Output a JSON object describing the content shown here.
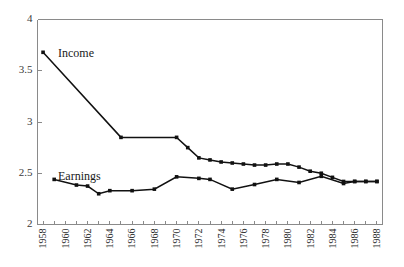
{
  "chart_data": {
    "type": "line",
    "title": "",
    "subtitle": "",
    "xlabel": "",
    "ylabel": "",
    "xlim": [
      1957.5,
      1988.5
    ],
    "ylim": [
      2,
      4
    ],
    "yticks": [
      2,
      2.5,
      3,
      3.5,
      4
    ],
    "ytick_labels": [
      "2",
      "2.5",
      "3",
      "3.5",
      "4"
    ],
    "xticks": [
      1958,
      1959,
      1960,
      1961,
      1962,
      1963,
      1964,
      1965,
      1966,
      1967,
      1968,
      1969,
      1970,
      1971,
      1972,
      1973,
      1974,
      1975,
      1976,
      1977,
      1978,
      1979,
      1980,
      1981,
      1982,
      1983,
      1984,
      1985,
      1986,
      1987,
      1988
    ],
    "xtick_labels": [
      "1958",
      "",
      "1960",
      "",
      "1962",
      "",
      "1964",
      "",
      "1966",
      "",
      "1968",
      "",
      "1970",
      "",
      "1972",
      "",
      "1974",
      "",
      "1976",
      "",
      "1978",
      "",
      "1980",
      "",
      "1982",
      "",
      "1984",
      "",
      "1986",
      "",
      "1988"
    ],
    "grid": false,
    "legend_position": "inline-annotation",
    "marker": "square",
    "series": [
      {
        "name": "Income",
        "annotation_label": "Income",
        "color": "#111111",
        "x": [
          1958,
          1965,
          1970,
          1971,
          1972,
          1973,
          1974,
          1975,
          1976,
          1977,
          1978,
          1979,
          1980,
          1981,
          1982,
          1983,
          1984,
          1985,
          1986,
          1987,
          1988
        ],
        "values": [
          3.68,
          2.85,
          2.85,
          2.75,
          2.65,
          2.63,
          2.61,
          2.6,
          2.59,
          2.58,
          2.58,
          2.59,
          2.59,
          2.56,
          2.52,
          2.5,
          2.46,
          2.42,
          2.42,
          2.42,
          2.42
        ]
      },
      {
        "name": "Earnings",
        "annotation_label": "Earnings",
        "color": "#111111",
        "x": [
          1959,
          1961,
          1962,
          1963,
          1964,
          1966,
          1968,
          1970,
          1972,
          1973,
          1975,
          1977,
          1979,
          1981,
          1983,
          1985,
          1986,
          1987,
          1988
        ],
        "values": [
          2.44,
          2.385,
          2.375,
          2.3,
          2.33,
          2.33,
          2.345,
          2.465,
          2.45,
          2.44,
          2.345,
          2.39,
          2.44,
          2.41,
          2.47,
          2.4,
          2.42,
          2.42,
          2.42
        ]
      }
    ],
    "annotations": [
      {
        "text": "Income",
        "x_px": 58,
        "y_px": 57
      },
      {
        "text": "Earnings",
        "x_px": 58,
        "y_px": 180
      }
    ]
  }
}
